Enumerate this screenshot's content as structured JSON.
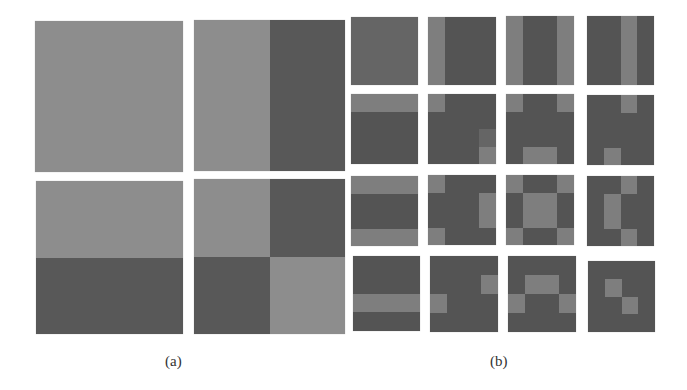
{
  "figure": {
    "panel_a": {
      "label": "(a)",
      "grid_size": 2,
      "colors": {
        "L": "#8d8d8d",
        "D": "#585858"
      },
      "tiles": [
        {
          "x": 35,
          "y": 21,
          "w": 148,
          "h": 151,
          "pattern": [
            [
              "L",
              "L"
            ],
            [
              "L",
              "L"
            ]
          ]
        },
        {
          "x": 194,
          "y": 20,
          "w": 151,
          "h": 151,
          "pattern": [
            [
              "L",
              "D"
            ],
            [
              "L",
              "D"
            ]
          ]
        },
        {
          "x": 36,
          "y": 181,
          "w": 147,
          "h": 153,
          "pattern": [
            [
              "L",
              "L"
            ],
            [
              "D",
              "D"
            ]
          ]
        },
        {
          "x": 194,
          "y": 179,
          "w": 151,
          "h": 155,
          "pattern": [
            [
              "L",
              "D"
            ],
            [
              "D",
              "L"
            ]
          ]
        }
      ]
    },
    "panel_b": {
      "label": "(b)",
      "grid_size": 4,
      "colors": {
        "L": "#7e7e7e",
        "M": "#656565",
        "D": "#545454"
      },
      "tiles": [
        {
          "x": 351,
          "y": 17,
          "w": 67,
          "h": 68,
          "pattern": [
            [
              "M",
              "M",
              "M",
              "M"
            ],
            [
              "M",
              "M",
              "M",
              "M"
            ],
            [
              "M",
              "M",
              "M",
              "M"
            ],
            [
              "M",
              "M",
              "M",
              "M"
            ]
          ]
        },
        {
          "x": 428,
          "y": 17,
          "w": 68,
          "h": 68,
          "pattern": [
            [
              "L",
              "D",
              "D",
              "D"
            ],
            [
              "L",
              "D",
              "D",
              "D"
            ],
            [
              "L",
              "D",
              "D",
              "D"
            ],
            [
              "L",
              "D",
              "D",
              "D"
            ]
          ]
        },
        {
          "x": 506,
          "y": 16,
          "w": 68,
          "h": 69,
          "pattern": [
            [
              "L",
              "D",
              "D",
              "L"
            ],
            [
              "L",
              "D",
              "D",
              "L"
            ],
            [
              "L",
              "D",
              "D",
              "L"
            ],
            [
              "L",
              "D",
              "D",
              "L"
            ]
          ]
        },
        {
          "x": 587,
          "y": 16,
          "w": 67,
          "h": 69,
          "pattern": [
            [
              "D",
              "D",
              "L",
              "D"
            ],
            [
              "D",
              "D",
              "L",
              "D"
            ],
            [
              "D",
              "D",
              "L",
              "D"
            ],
            [
              "D",
              "D",
              "L",
              "D"
            ]
          ]
        },
        {
          "x": 351,
          "y": 94,
          "w": 67,
          "h": 70,
          "pattern": [
            [
              "L",
              "L",
              "L",
              "L"
            ],
            [
              "D",
              "D",
              "D",
              "D"
            ],
            [
              "D",
              "D",
              "D",
              "D"
            ],
            [
              "D",
              "D",
              "D",
              "D"
            ]
          ]
        },
        {
          "x": 428,
          "y": 94,
          "w": 68,
          "h": 70,
          "pattern": [
            [
              "L",
              "D",
              "D",
              "D"
            ],
            [
              "D",
              "D",
              "D",
              "D"
            ],
            [
              "D",
              "D",
              "D",
              "M"
            ],
            [
              "D",
              "D",
              "D",
              "L"
            ]
          ]
        },
        {
          "x": 506,
          "y": 94,
          "w": 68,
          "h": 70,
          "pattern": [
            [
              "L",
              "D",
              "D",
              "L"
            ],
            [
              "D",
              "D",
              "D",
              "D"
            ],
            [
              "D",
              "D",
              "D",
              "D"
            ],
            [
              "D",
              "L",
              "L",
              "D"
            ]
          ]
        },
        {
          "x": 587,
          "y": 95,
          "w": 67,
          "h": 70,
          "pattern": [
            [
              "D",
              "D",
              "L",
              "D"
            ],
            [
              "D",
              "D",
              "D",
              "D"
            ],
            [
              "D",
              "D",
              "D",
              "D"
            ],
            [
              "D",
              "L",
              "D",
              "D"
            ]
          ]
        },
        {
          "x": 351,
          "y": 176,
          "w": 67,
          "h": 70,
          "pattern": [
            [
              "L",
              "L",
              "L",
              "L"
            ],
            [
              "D",
              "D",
              "D",
              "D"
            ],
            [
              "D",
              "D",
              "D",
              "D"
            ],
            [
              "L",
              "L",
              "L",
              "L"
            ]
          ]
        },
        {
          "x": 428,
          "y": 175,
          "w": 68,
          "h": 70,
          "pattern": [
            [
              "L",
              "D",
              "D",
              "D"
            ],
            [
              "D",
              "D",
              "D",
              "L"
            ],
            [
              "D",
              "D",
              "D",
              "L"
            ],
            [
              "L",
              "D",
              "D",
              "D"
            ]
          ]
        },
        {
          "x": 506,
          "y": 175,
          "w": 68,
          "h": 70,
          "pattern": [
            [
              "L",
              "D",
              "D",
              "L"
            ],
            [
              "D",
              "L",
              "L",
              "D"
            ],
            [
              "D",
              "L",
              "L",
              "D"
            ],
            [
              "L",
              "D",
              "D",
              "L"
            ]
          ]
        },
        {
          "x": 587,
          "y": 176,
          "w": 67,
          "h": 70,
          "pattern": [
            [
              "D",
              "D",
              "L",
              "D"
            ],
            [
              "D",
              "L",
              "D",
              "D"
            ],
            [
              "D",
              "L",
              "D",
              "D"
            ],
            [
              "D",
              "D",
              "L",
              "D"
            ]
          ]
        },
        {
          "x": 353,
          "y": 256,
          "w": 67,
          "h": 75,
          "pattern": [
            [
              "D",
              "D",
              "D",
              "D"
            ],
            [
              "D",
              "D",
              "D",
              "D"
            ],
            [
              "L",
              "L",
              "L",
              "L"
            ],
            [
              "D",
              "D",
              "D",
              "D"
            ]
          ]
        },
        {
          "x": 430,
          "y": 256,
          "w": 68,
          "h": 76,
          "pattern": [
            [
              "D",
              "D",
              "D",
              "D"
            ],
            [
              "D",
              "D",
              "D",
              "L"
            ],
            [
              "L",
              "D",
              "D",
              "D"
            ],
            [
              "D",
              "D",
              "D",
              "D"
            ]
          ]
        },
        {
          "x": 508,
          "y": 256,
          "w": 68,
          "h": 76,
          "pattern": [
            [
              "D",
              "D",
              "D",
              "D"
            ],
            [
              "D",
              "L",
              "L",
              "D"
            ],
            [
              "L",
              "D",
              "D",
              "L"
            ],
            [
              "D",
              "D",
              "D",
              "D"
            ]
          ]
        },
        {
          "x": 588,
          "y": 261,
          "w": 67,
          "h": 71,
          "pattern": [
            [
              "D",
              "D",
              "D",
              "D"
            ],
            [
              "D",
              "L",
              "D",
              "D"
            ],
            [
              "D",
              "D",
              "L",
              "D"
            ],
            [
              "D",
              "D",
              "D",
              "D"
            ]
          ]
        }
      ]
    }
  }
}
